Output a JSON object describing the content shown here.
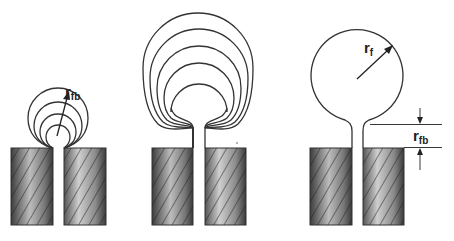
{
  "figure": {
    "colors": {
      "stroke": "#333333",
      "block_dark": "#4a4a4a",
      "block_light": "#c8c8c8",
      "background": "#ffffff"
    },
    "panels": [
      {
        "id": "panel-1",
        "label_main": "r",
        "label_sub": "fb",
        "caption": "Growing circles of radius r_fb at the slit exit"
      },
      {
        "id": "panel-2",
        "caption": "Nested expanding bubbles with necking stem"
      },
      {
        "id": "panel-3",
        "radius_label_main": "r",
        "radius_label_sub": "f",
        "dim_label_main": "r",
        "dim_label_sub": "fb",
        "caption": "Final bubble of radius r_f on stem of height r_fb"
      }
    ]
  }
}
